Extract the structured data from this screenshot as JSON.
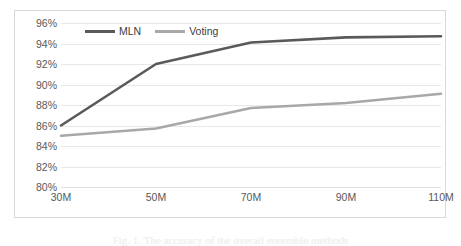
{
  "chart_data": {
    "type": "line",
    "title": "",
    "xlabel": "",
    "ylabel": "",
    "categories": [
      "30M",
      "50M",
      "70M",
      "90M",
      "110M"
    ],
    "ylim": [
      80,
      96
    ],
    "y_ticks": [
      "80%",
      "82%",
      "84%",
      "86%",
      "88%",
      "90%",
      "92%",
      "94%",
      "96%"
    ],
    "y_tick_values": [
      80,
      82,
      84,
      86,
      88,
      90,
      92,
      94,
      96
    ],
    "grid": true,
    "legend_position": "top-left-inside",
    "series": [
      {
        "name": "MLN",
        "color": "#5a5a5a",
        "values": [
          86.0,
          92.0,
          94.1,
          94.6,
          94.7
        ]
      },
      {
        "name": "Voting",
        "color": "#a8a8a8",
        "values": [
          85.0,
          85.7,
          87.7,
          88.2,
          89.1
        ]
      }
    ]
  },
  "legend": {
    "items": [
      {
        "label": "MLN",
        "color": "#5a5a5a"
      },
      {
        "label": "Voting",
        "color": "#a8a8a8"
      }
    ]
  },
  "caption": {
    "text": "Fig. 1. The accuracy of the overall ensemble methods"
  }
}
